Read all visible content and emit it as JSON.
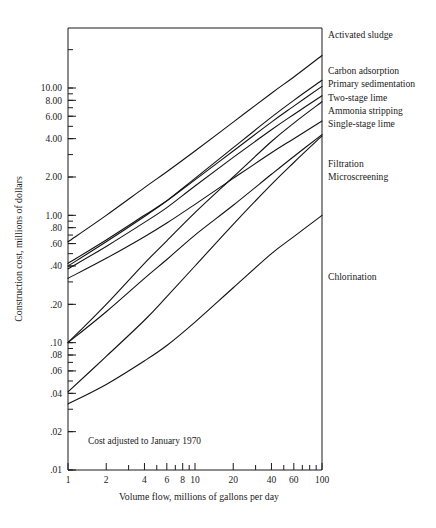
{
  "chart_data": {
    "type": "line",
    "title": "",
    "xlabel": "Volume flow, millions of gallons per day",
    "ylabel": "Construction cost, millions of dollars",
    "note": "Cost adjusted to January 1970",
    "xscale": "log",
    "yscale": "log",
    "xlim": [
      1,
      100
    ],
    "ylim": [
      0.01,
      30
    ],
    "grid": false,
    "legend_position": "right-of-axes (inline end labels)",
    "xticks_labeled": [
      1,
      2,
      4,
      6,
      8,
      10,
      20,
      40,
      60,
      100
    ],
    "xtick_labels": [
      "1",
      "2",
      "4",
      "6",
      "8",
      "10",
      "20",
      "40",
      "60",
      "100"
    ],
    "xticks_minor": [
      1,
      2,
      3,
      4,
      5,
      6,
      7,
      8,
      9,
      10,
      20,
      30,
      40,
      50,
      60,
      70,
      80,
      90,
      100
    ],
    "yticks_labeled": [
      10.0,
      8.0,
      6.0,
      4.0,
      2.0,
      1.0,
      0.8,
      0.6,
      0.4,
      0.2,
      0.1,
      0.08,
      0.06,
      0.04,
      0.02,
      0.01
    ],
    "ytick_labels": [
      "10.00",
      "8.00",
      "6.00",
      "4.00",
      "2.00",
      "1.00",
      ".80",
      ".60",
      ".40",
      ".20",
      ".10",
      ".08",
      ".06",
      ".04",
      ".02",
      ".01"
    ],
    "yticks_minor": [
      0.01,
      0.02,
      0.03,
      0.04,
      0.05,
      0.06,
      0.07,
      0.08,
      0.09,
      0.1,
      0.2,
      0.3,
      0.4,
      0.5,
      0.6,
      0.7,
      0.8,
      0.9,
      1,
      2,
      3,
      4,
      5,
      6,
      7,
      8,
      9,
      10,
      20
    ],
    "series": [
      {
        "name": "Activated sludge",
        "label": "Activated sludge",
        "x": [
          1,
          2,
          4,
          6,
          10,
          20,
          40,
          60,
          100
        ],
        "y": [
          0.62,
          1.0,
          1.65,
          2.2,
          3.2,
          5.4,
          9.1,
          12.2,
          18.0
        ]
      },
      {
        "name": "Carbon adsorption",
        "label": "Carbon adsorption",
        "x": [
          1,
          2,
          4,
          6,
          10,
          20,
          40,
          60,
          100
        ],
        "y": [
          0.4,
          0.62,
          0.98,
          1.3,
          1.95,
          3.4,
          5.9,
          8.0,
          11.5
        ]
      },
      {
        "name": "Primary sedimentation",
        "label": "Primary sedimentation",
        "x": [
          1,
          2,
          4,
          6,
          10,
          20,
          40,
          60,
          100
        ],
        "y": [
          0.42,
          0.64,
          1.0,
          1.3,
          1.9,
          3.2,
          5.4,
          7.2,
          10.3
        ]
      },
      {
        "name": "Two-stage lime",
        "label": "Two-stage lime",
        "x": [
          1,
          2,
          4,
          6,
          10,
          20,
          40,
          60,
          100
        ],
        "y": [
          0.38,
          0.57,
          0.88,
          1.15,
          1.7,
          2.85,
          4.7,
          6.2,
          8.7
        ]
      },
      {
        "name": "Ammonia stripping",
        "label": "Ammonia stripping",
        "x": [
          1,
          2,
          4,
          6,
          10,
          20,
          40,
          60,
          100
        ],
        "y": [
          0.1,
          0.2,
          0.42,
          0.63,
          1.05,
          2.0,
          3.8,
          5.3,
          7.8
        ]
      },
      {
        "name": "Single-stage lime",
        "label": "Single-stage lime",
        "x": [
          1,
          2,
          4,
          6,
          10,
          20,
          40,
          60,
          100
        ],
        "y": [
          0.32,
          0.46,
          0.68,
          0.87,
          1.22,
          1.95,
          3.1,
          4.0,
          5.5
        ]
      },
      {
        "name": "Filtration",
        "label": "Filtration",
        "x": [
          1,
          2,
          4,
          6,
          10,
          20,
          40,
          60,
          100
        ],
        "y": [
          0.1,
          0.175,
          0.32,
          0.45,
          0.7,
          1.2,
          2.1,
          2.9,
          4.3
        ]
      },
      {
        "name": "Microscreening",
        "label": "Microscreening",
        "x": [
          1,
          2,
          4,
          6,
          10,
          20,
          40,
          60,
          100
        ],
        "y": [
          0.041,
          0.078,
          0.15,
          0.23,
          0.4,
          0.85,
          1.75,
          2.6,
          4.2
        ]
      },
      {
        "name": "Chlorination",
        "label": "Chlorination",
        "x": [
          1,
          2,
          4,
          6,
          10,
          20,
          40,
          60,
          100
        ],
        "y": [
          0.033,
          0.047,
          0.072,
          0.095,
          0.145,
          0.27,
          0.5,
          0.68,
          1.0
        ]
      }
    ],
    "end_labels": [
      {
        "label": "Activated sludge",
        "y_px": 38
      },
      {
        "label": "Carbon adsorption",
        "y_px": 74
      },
      {
        "label": "Primary sedimentation",
        "y_px": 87
      },
      {
        "label": "Two-stage lime",
        "y_px": 101
      },
      {
        "label": "Ammonia stripping",
        "y_px": 114
      },
      {
        "label": "Single-stage lime",
        "y_px": 127
      },
      {
        "label": "Filtration",
        "y_px": 167
      },
      {
        "label": "Microscreening",
        "y_px": 180
      },
      {
        "label": "Chlorination",
        "y_px": 280
      }
    ],
    "colors": {
      "axis": "#1a1a1a",
      "curve": "#111111",
      "background": "#ffffff"
    }
  }
}
